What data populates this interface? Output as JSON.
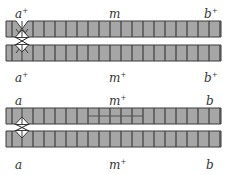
{
  "diagram": {
    "type": "chromosome-pairs",
    "colors": {
      "chromatid_fill": "#a6a6a6",
      "band_line": "#444444",
      "outline": "#3a3a3a",
      "label": "#333333"
    },
    "pairs": [
      {
        "id": "pair-1",
        "top_labels": [
          {
            "name": "a",
            "sup": "+"
          },
          {
            "name": "m",
            "sup": ""
          },
          {
            "name": "b",
            "sup": "+"
          }
        ],
        "bottom_labels": [
          {
            "name": "a",
            "sup": "+"
          },
          {
            "name": "m",
            "sup": "+"
          },
          {
            "name": "b",
            "sup": "+"
          }
        ],
        "highlight_region": false
      },
      {
        "id": "pair-2",
        "top_labels": [
          {
            "name": "a",
            "sup": ""
          },
          {
            "name": "m",
            "sup": "+"
          },
          {
            "name": "b",
            "sup": ""
          }
        ],
        "bottom_labels": [
          {
            "name": "a",
            "sup": ""
          },
          {
            "name": "m",
            "sup": "+"
          },
          {
            "name": "b",
            "sup": ""
          }
        ],
        "highlight_region": true
      }
    ]
  }
}
